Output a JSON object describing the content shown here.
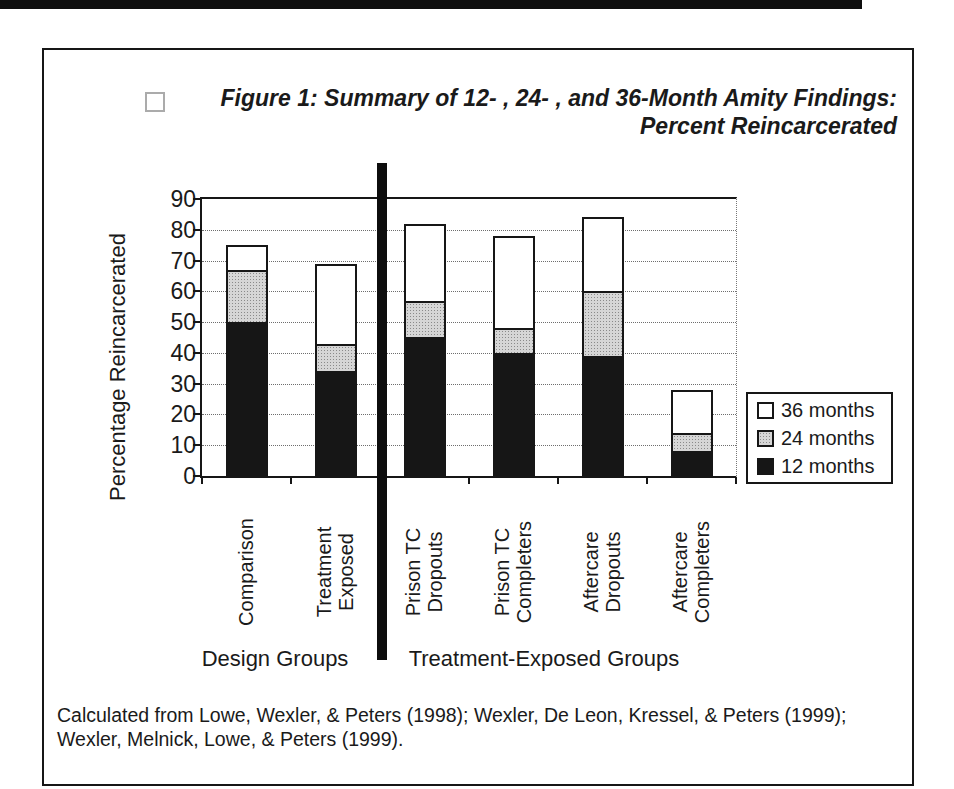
{
  "figure": {
    "title_line1": "Figure 1: Summary of 12- , 24- , and 36-Month Amity Findings:",
    "title_line2": "Percent Reincarcerated",
    "title_marker_icon": "checkbox-outline"
  },
  "chart_data": {
    "type": "bar",
    "stacked": true,
    "values_are_cumulative": true,
    "title": "Figure 1: Summary of 12- , 24- , and 36-Month Amity Findings: Percent Reincarcerated",
    "ylabel": "Percentage Reincarcerated",
    "xlabel": "",
    "ylim": [
      0,
      90
    ],
    "ytick_step": 10,
    "grid": "dotted-horizontal",
    "legend_position": "right-inside",
    "legend": [
      {
        "label": "36 months",
        "swatch": "white"
      },
      {
        "label": "24 months",
        "swatch": "stipple-gray"
      },
      {
        "label": "12 months",
        "swatch": "black"
      }
    ],
    "categories": [
      "Comparison",
      "Treatment Exposed",
      "Prison TC Dropouts",
      "Prison TC Completers",
      "Aftercare Dropouts",
      "Aftercare Completers"
    ],
    "category_label_lines": [
      [
        "Comparison"
      ],
      [
        "Treatment",
        "Exposed"
      ],
      [
        "Prison TC",
        "Dropouts"
      ],
      [
        "Prison TC",
        "Completers"
      ],
      [
        "Aftercare",
        "Dropouts"
      ],
      [
        "Aftercare",
        "Completers"
      ]
    ],
    "series": [
      {
        "name": "12 months",
        "color": "#161616",
        "pattern": "solid",
        "values": [
          50,
          34,
          45,
          40,
          39,
          8
        ]
      },
      {
        "name": "24 months",
        "color": "#d6d6d6",
        "pattern": "stipple",
        "values": [
          67,
          43,
          57,
          48,
          60,
          14
        ]
      },
      {
        "name": "36 months",
        "color": "#ffffff",
        "pattern": "solid",
        "values": [
          75,
          69,
          82,
          78,
          84,
          28
        ]
      }
    ],
    "group_axis": [
      {
        "label": "Design Groups",
        "category_span": [
          0,
          1
        ],
        "center_x": 275
      },
      {
        "label": "Treatment-Exposed Groups",
        "category_span": [
          2,
          5
        ],
        "center_x": 544
      }
    ],
    "separator_between_groups": true
  },
  "citation": {
    "line1": "Calculated from Lowe, Wexler, & Peters (1998); Wexler, De Leon, Kressel, & Peters (1999);",
    "line2": "Wexler, Melnick, Lowe, & Peters (1999)."
  }
}
